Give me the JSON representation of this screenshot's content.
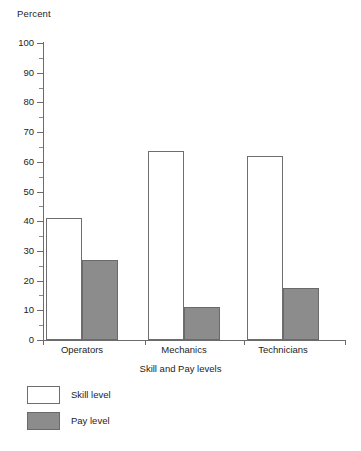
{
  "chart_data": {
    "type": "bar",
    "title": "",
    "subtitle": "",
    "ylabel": "Percent",
    "xlabel": "Skill and Pay levels",
    "categories": [
      "Operators",
      "Mechanics",
      "Technicians"
    ],
    "series": [
      {
        "name": "Skill level",
        "values": [
          41,
          63.5,
          62
        ],
        "color": "#ffffff",
        "border": "#6e6e6e"
      },
      {
        "name": "Pay level",
        "values": [
          27,
          11,
          17.5
        ],
        "color": "#8c8c8c",
        "border": "#6a6a6a"
      }
    ],
    "ylim": [
      0,
      100
    ],
    "ytick_major_step": 10,
    "ytick_minor_step": 5,
    "ytick_labels": [
      "0",
      "10",
      "20",
      "30",
      "40",
      "50",
      "60",
      "70",
      "80",
      "90",
      "100"
    ],
    "grid": false,
    "legend_position": "below-left",
    "legend_orientation": "vertical"
  },
  "axes": {
    "y_title": "Percent",
    "x_title": "Skill and Pay levels"
  },
  "legend": {
    "items": [
      {
        "label": "Skill level"
      },
      {
        "label": "Pay level"
      }
    ]
  }
}
